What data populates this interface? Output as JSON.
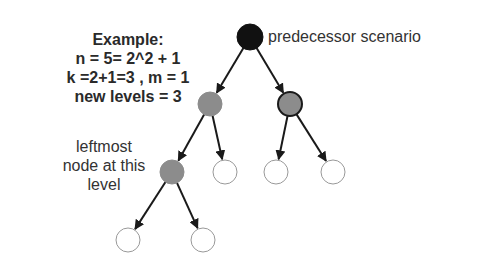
{
  "example": {
    "title": "Example:",
    "lines": [
      "n = 5= 2^2 + 1",
      "k =2+1=3 , m = 1",
      "new levels = 3"
    ]
  },
  "labels": {
    "root": "predecessor scenario",
    "leftmost": [
      "leftmost",
      "node at this",
      "level"
    ]
  },
  "tree": {
    "nodes": [
      {
        "id": "root",
        "x": 250,
        "y": 37,
        "fill": "#111111",
        "stroke": "#111111"
      },
      {
        "id": "l2a",
        "x": 210,
        "y": 104,
        "fill": "#8c8c8c",
        "stroke": "#8c8c8c"
      },
      {
        "id": "l2b",
        "x": 290,
        "y": 104,
        "fill": "#8c8c8c",
        "stroke": "#1a1a1a"
      },
      {
        "id": "l3a",
        "x": 172,
        "y": 172,
        "fill": "#8c8c8c",
        "stroke": "#8c8c8c"
      },
      {
        "id": "l3b",
        "x": 225,
        "y": 172,
        "fill": "#ffffff",
        "stroke": "#999999"
      },
      {
        "id": "l3c",
        "x": 276,
        "y": 172,
        "fill": "#ffffff",
        "stroke": "#999999"
      },
      {
        "id": "l3d",
        "x": 333,
        "y": 172,
        "fill": "#ffffff",
        "stroke": "#999999"
      },
      {
        "id": "l4a",
        "x": 128,
        "y": 240,
        "fill": "#ffffff",
        "stroke": "#999999"
      },
      {
        "id": "l4b",
        "x": 203,
        "y": 240,
        "fill": "#ffffff",
        "stroke": "#999999"
      }
    ],
    "edges": [
      [
        "root",
        "l2a"
      ],
      [
        "root",
        "l2b"
      ],
      [
        "l2a",
        "l3a"
      ],
      [
        "l2a",
        "l3b"
      ],
      [
        "l2b",
        "l3c"
      ],
      [
        "l2b",
        "l3d"
      ],
      [
        "l3a",
        "l4a"
      ],
      [
        "l3a",
        "l4b"
      ]
    ],
    "radius": 12
  }
}
